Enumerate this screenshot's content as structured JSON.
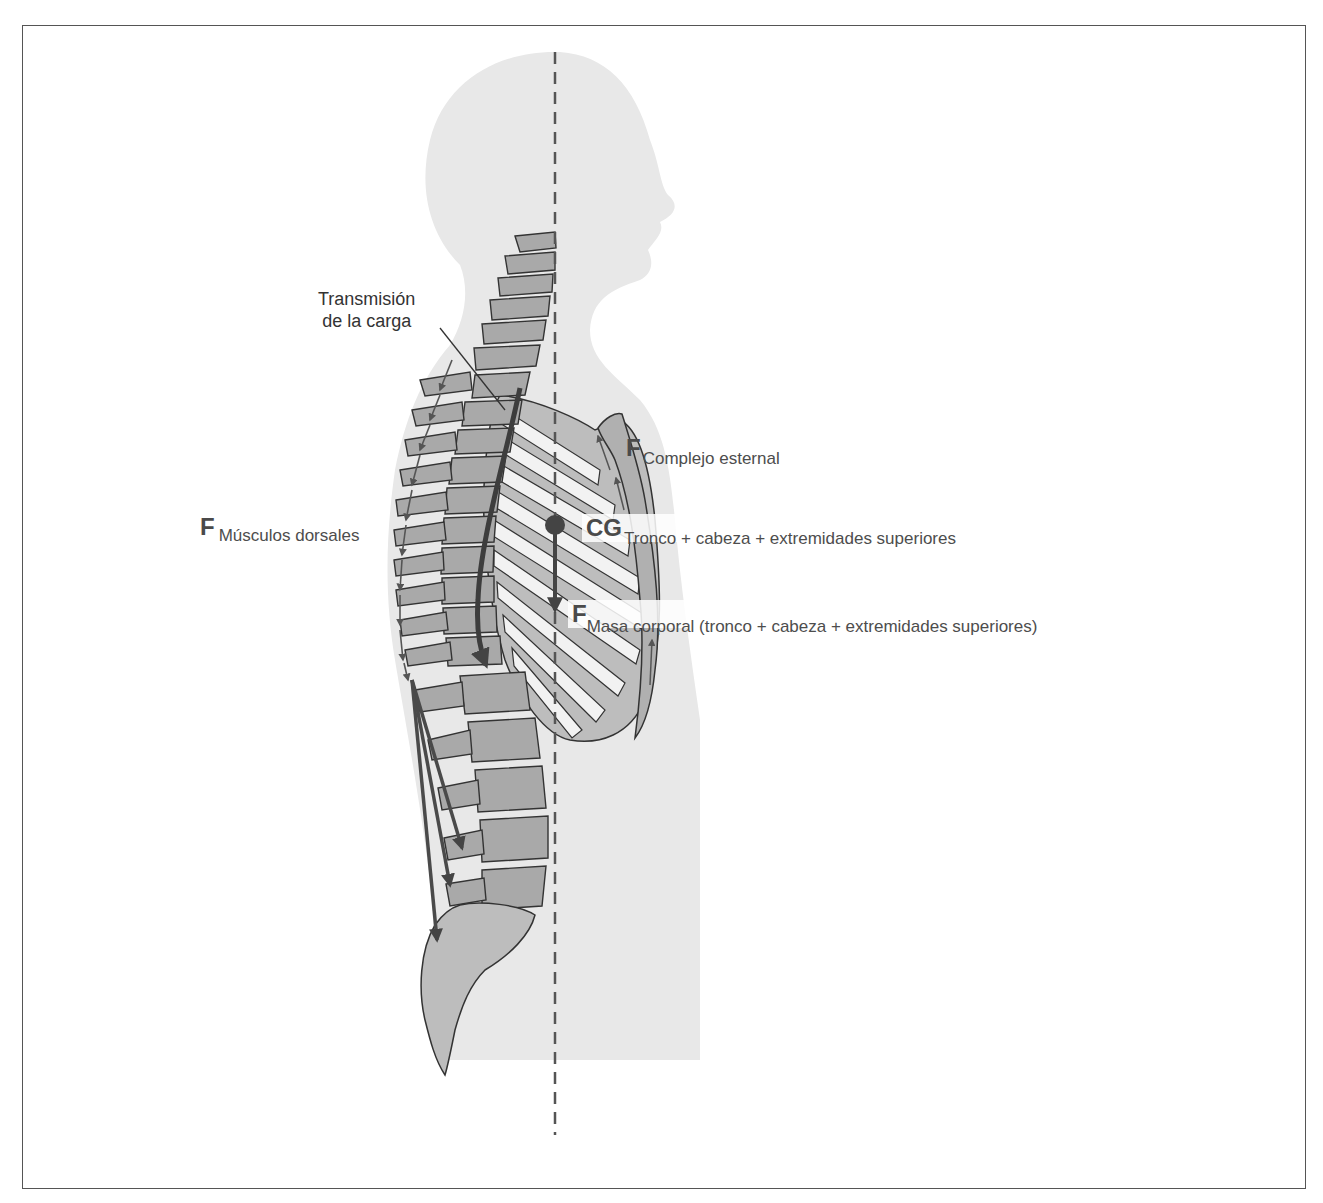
{
  "diagram": {
    "title": "",
    "colors": {
      "silhouette": "#e6e6e6",
      "bone_fill": "#a8a8a8",
      "bone_stroke": "#333333",
      "arrow": "#555555",
      "dashed_line": "#555555",
      "frame": "#555555"
    },
    "labels": {
      "load_transmission": {
        "line1": "Transmisión",
        "line2": "de la carga"
      },
      "sternal_force": {
        "symbol": "F",
        "subscript": "Complejo esternal"
      },
      "dorsal_muscles_force": {
        "symbol": "F",
        "subscript": "Músculos dorsales"
      },
      "center_of_gravity": {
        "symbol": "CG",
        "subscript": "Tronco + cabeza + extremidades superiores"
      },
      "body_mass_force": {
        "symbol": "F",
        "subscript": "Masa corporal (tronco + cabeza + extremidades superiores)"
      }
    },
    "elements": [
      "head-and-trunk-silhouette",
      "vertical-gravity-line",
      "cervical-spine",
      "thoracic-spine",
      "lumbar-spine",
      "sacrum-coccyx",
      "rib-cage",
      "sternum",
      "load-transmission-arrow",
      "dorsal-muscle-arrows",
      "lumbar-muscle-arrows",
      "sternal-arrows",
      "center-of-gravity-dot",
      "body-mass-arrow"
    ]
  }
}
